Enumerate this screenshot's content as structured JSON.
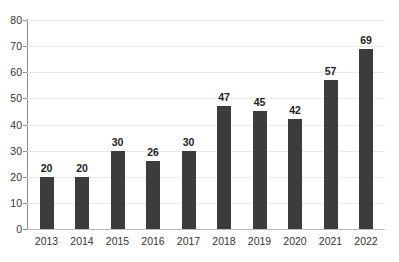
{
  "chart_data": {
    "type": "bar",
    "title": "",
    "subtitle": "",
    "xlabel": "",
    "ylabel": "",
    "categories": [
      "2013",
      "2014",
      "2015",
      "2016",
      "2017",
      "2018",
      "2019",
      "2020",
      "2021",
      "2022"
    ],
    "values": [
      20,
      20,
      30,
      26,
      30,
      47,
      45,
      42,
      57,
      69
    ],
    "ylim": [
      0,
      80
    ],
    "y_ticks": [
      0,
      10,
      20,
      30,
      40,
      50,
      60,
      70,
      80
    ],
    "y_tick_labels": [
      "0",
      "10",
      "20",
      "30",
      "40",
      "50",
      "60",
      "70",
      "80"
    ],
    "data_labels": [
      "20",
      "20",
      "30",
      "26",
      "30",
      "47",
      "45",
      "42",
      "57",
      "69"
    ],
    "grid": true,
    "legend": false,
    "legend_position": "none",
    "series_color": "#3c3c3c",
    "gridline_color": "#e9e9e9",
    "axis_color": "#8e8e8e",
    "background_color": "#ffffff"
  }
}
